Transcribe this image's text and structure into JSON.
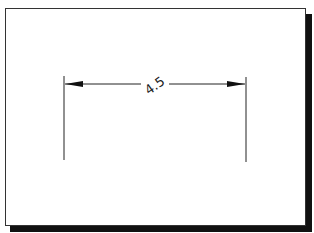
{
  "diagram": {
    "type": "dimension-line",
    "dimension_label": "4.5",
    "colors": {
      "line": "#222222",
      "frame_border": "#333333",
      "shadow": "#111111",
      "background": "#ffffff"
    }
  }
}
